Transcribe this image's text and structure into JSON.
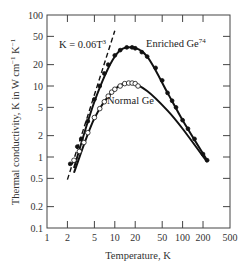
{
  "chart_data": {
    "type": "line",
    "title": "",
    "xlabel": "Temperature, K",
    "ylabel": "Thermal conductivity, K in W cm^-1 K^-1",
    "xscale": "log",
    "yscale": "log",
    "xlim": [
      1,
      500
    ],
    "ylim": [
      0.1,
      100
    ],
    "grid": false,
    "x_ticks": [
      "1",
      "2",
      "5",
      "10",
      "20",
      "50",
      "100",
      "200",
      "500"
    ],
    "y_ticks": [
      "0.1",
      "0.2",
      "0.5",
      "1",
      "2",
      "5",
      "10",
      "20",
      "50",
      "100"
    ],
    "annotations": [
      {
        "text": "K = 0.06T",
        "sup": "3",
        "label": "dashed line"
      },
      {
        "text": "Enriched Ge",
        "sup": "74"
      },
      {
        "text": "Normal Ge",
        "sup": ""
      }
    ],
    "series": [
      {
        "name": "Enriched Ge74",
        "marker": "filled-circle",
        "x": [
          2.2,
          2.8,
          3.2,
          4,
          5,
          6,
          7,
          8,
          10,
          12,
          15,
          18,
          20,
          25,
          30,
          40,
          50,
          60,
          70,
          80,
          100,
          120,
          150,
          200,
          230
        ],
        "y": [
          0.8,
          1.4,
          1.8,
          3.2,
          6.5,
          10,
          15,
          20,
          27,
          32,
          35,
          35,
          34,
          30,
          26,
          18,
          12,
          8,
          6.2,
          5,
          3.3,
          2.5,
          1.8,
          1.1,
          0.9
        ]
      },
      {
        "name": "Normal Ge",
        "marker": "open-circle",
        "x": [
          2.5,
          3,
          3.5,
          4,
          5,
          6,
          7,
          8,
          9,
          10,
          12,
          14,
          16,
          18,
          20,
          22
        ],
        "y": [
          0.9,
          1.2,
          1.6,
          2.2,
          3.6,
          4.8,
          6,
          7.2,
          8.2,
          9,
          10,
          10.8,
          11,
          11,
          10.8,
          10
        ]
      },
      {
        "name": "K = 0.06T^3",
        "style": "dashed",
        "x": [
          2,
          10
        ],
        "y": [
          0.48,
          60
        ]
      }
    ],
    "fit_curves": [
      {
        "name": "Enriched Ge74 fit",
        "x": [
          2.5,
          5,
          10,
          17,
          30,
          60,
          100,
          230
        ],
        "y": [
          0.7,
          6,
          26,
          35,
          26,
          8,
          3.3,
          0.9
        ]
      },
      {
        "name": "Normal Ge fit",
        "x": [
          2.5,
          5,
          10,
          17,
          30,
          60,
          100,
          230
        ],
        "y": [
          0.6,
          3.5,
          9,
          11,
          8.5,
          4.5,
          2.5,
          0.85
        ]
      }
    ]
  }
}
